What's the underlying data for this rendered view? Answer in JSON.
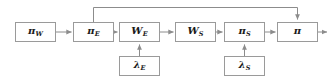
{
  "diagram": {
    "type": "block-flow-diagram",
    "background_color": "#ffffff",
    "box_border_color": "#9a9a9a",
    "line_color": "#8c8c8c",
    "text_color": "#1a1a1a",
    "nodes": [
      {
        "id": "pi_w",
        "symbol": "π",
        "subscript": "W",
        "x": 15,
        "y": 22,
        "w": 41,
        "h": 20
      },
      {
        "id": "pi_e",
        "symbol": "π",
        "subscript": "E",
        "x": 73,
        "y": 22,
        "w": 41,
        "h": 20
      },
      {
        "id": "w_e",
        "symbol": "W",
        "subscript": "E",
        "x": 119,
        "y": 22,
        "w": 41,
        "h": 20
      },
      {
        "id": "w_s",
        "symbol": "W",
        "subscript": "S",
        "x": 175,
        "y": 22,
        "w": 41,
        "h": 20
      },
      {
        "id": "pi_s",
        "symbol": "π",
        "subscript": "S",
        "x": 224,
        "y": 22,
        "w": 41,
        "h": 20
      },
      {
        "id": "pi_out",
        "symbol": "π",
        "subscript": "",
        "x": 277,
        "y": 22,
        "w": 41,
        "h": 20
      },
      {
        "id": "lambda_e",
        "symbol": "λ",
        "subscript": "E",
        "x": 119,
        "y": 56,
        "w": 41,
        "h": 20
      },
      {
        "id": "lambda_s",
        "symbol": "λ",
        "subscript": "S",
        "x": 224,
        "y": 56,
        "w": 41,
        "h": 20
      }
    ],
    "edges": [
      {
        "id": "e-piw-pie",
        "from": "pi_w",
        "to": "pi_e",
        "direction": "right"
      },
      {
        "id": "e-pie-we",
        "from": "pi_e",
        "to": "w_e",
        "direction": "right"
      },
      {
        "id": "e-we-ws",
        "from": "w_e",
        "to": "w_s",
        "direction": "right"
      },
      {
        "id": "e-ws-pis",
        "from": "w_s",
        "to": "pi_s",
        "direction": "right"
      },
      {
        "id": "e-pis-piout",
        "from": "pi_s",
        "to": "pi_out",
        "direction": "right"
      },
      {
        "id": "e-piout-exit",
        "from": "pi_out",
        "to": "output",
        "direction": "right"
      },
      {
        "id": "e-lambdae-we",
        "from": "lambda_e",
        "to": "w_e",
        "direction": "up"
      },
      {
        "id": "e-lambdas-pis",
        "from": "lambda_s",
        "to": "pi_s",
        "direction": "up"
      },
      {
        "id": "e-feedback",
        "from": "pi_e",
        "to": "pi_out",
        "direction": "over-top"
      }
    ]
  }
}
